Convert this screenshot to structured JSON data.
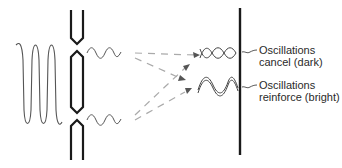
{
  "diagram": {
    "type": "double-slit interference",
    "labels": {
      "cancel": {
        "line1": "Oscillations",
        "line2": "cancel (dark)"
      },
      "reinforce": {
        "line1": "Oscillations",
        "line2": "reinforce (bright)"
      }
    },
    "colors": {
      "ink": "#1a1a1a",
      "wave": "#555555",
      "dashed": "#aaaaaa",
      "background": "#ffffff"
    }
  }
}
